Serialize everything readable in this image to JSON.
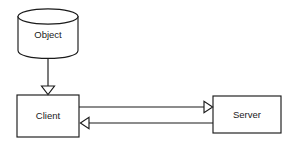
{
  "diagram": {
    "background_color": "#ffffff",
    "stroke_color": "#1a1a1a",
    "fill_color": "#ffffff",
    "nodes": [
      {
        "id": "object",
        "label": "Object",
        "shape": "cylinder",
        "x": 18,
        "y": 9,
        "width": 60,
        "height": 49,
        "label_x": 48,
        "label_y": 35
      },
      {
        "id": "client",
        "label": "Client",
        "shape": "rectangle",
        "x": 17,
        "y": 95,
        "width": 62,
        "height": 42,
        "label_x": 48,
        "label_y": 116
      },
      {
        "id": "server",
        "label": "Server",
        "shape": "rectangle",
        "x": 213,
        "y": 96,
        "width": 68,
        "height": 37,
        "label_x": 247,
        "label_y": 115
      }
    ],
    "connections": [
      {
        "id": "object-to-client",
        "from": "object",
        "to": "client",
        "direction": "down",
        "arrowhead": "hollow-triangle",
        "label": ""
      },
      {
        "id": "client-to-server",
        "from": "client",
        "to": "server",
        "direction": "right",
        "arrowhead": "hollow-triangle",
        "label": ""
      },
      {
        "id": "server-to-client",
        "from": "server",
        "to": "client",
        "direction": "left",
        "arrowhead": "hollow-triangle",
        "label": ""
      }
    ]
  }
}
